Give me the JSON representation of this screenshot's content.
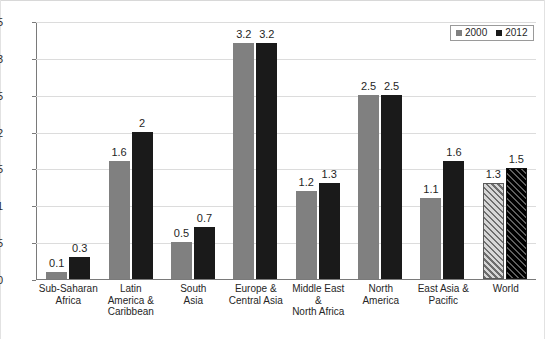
{
  "chart_data": {
    "type": "bar",
    "title": "",
    "xlabel": "",
    "ylabel": "",
    "ylim": [
      0,
      3.5
    ],
    "ytick_labels": [
      "3.5",
      "3",
      "2.5",
      "2",
      "1.5",
      "1",
      "0.5",
      "0"
    ],
    "yticks": [
      3.5,
      3,
      2.5,
      2,
      1.5,
      1,
      0.5,
      0
    ],
    "grid": true,
    "legend_position": "top-right",
    "categories": [
      "Sub-Saharan Africa",
      "Latin America & Caribbean",
      "South Asia",
      "Europe & Central Asia",
      "Middle East & North Africa",
      "North America",
      "East Asia & Pacific",
      "World"
    ],
    "category_lines": [
      [
        "Sub-Saharan",
        "Africa"
      ],
      [
        "Latin America &",
        "Caribbean"
      ],
      [
        "South",
        "Asia"
      ],
      [
        "Europe &",
        "Central Asia"
      ],
      [
        "Middle East &",
        "North Africa"
      ],
      [
        "North",
        "America"
      ],
      [
        "East Asia &",
        "Pacific"
      ],
      [
        "World"
      ]
    ],
    "series": [
      {
        "name": "2000",
        "color": "#808080",
        "values": [
          0.1,
          1.6,
          0.5,
          3.2,
          1.2,
          2.5,
          1.1,
          1.3
        ],
        "labels": [
          "0.1",
          "1.6",
          "0.5",
          "3.2",
          "1.2",
          "2.5",
          "1.1",
          "1.3"
        ]
      },
      {
        "name": "2012",
        "color": "#1a1a1a",
        "values": [
          0.3,
          2.0,
          0.7,
          3.2,
          1.3,
          2.5,
          1.6,
          1.5
        ],
        "labels": [
          "0.3",
          "2",
          "0.7",
          "3.2",
          "1.3",
          "2.5",
          "1.6",
          "1.5"
        ]
      }
    ],
    "hatched_categories": [
      "World"
    ]
  },
  "legend": {
    "items": [
      {
        "label": "2000",
        "swatch": "series-2000-swatch"
      },
      {
        "label": "2012",
        "swatch": "series-2012-swatch"
      }
    ]
  },
  "caption": {
    "text": ""
  }
}
